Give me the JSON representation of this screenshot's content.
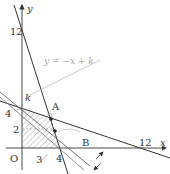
{
  "figure": {
    "axes": {
      "x_label": "x",
      "y_label": "y",
      "origin_label": "O",
      "x_ticks": [
        "3",
        "4",
        "12"
      ],
      "y_ticks": [
        "2",
        "4",
        "12"
      ]
    },
    "points": {
      "A": "A",
      "B": "B",
      "k": "k"
    },
    "equation_label": "y = −x + k",
    "lines": [
      {
        "name": "3x + y = 12",
        "through": [
          [
            0,
            12
          ],
          [
            4,
            0
          ]
        ]
      },
      {
        "name": "x + 3y = 12",
        "through": [
          [
            0,
            4
          ],
          [
            12,
            0
          ]
        ]
      },
      {
        "name": "y = -x + k (k=6, through A)",
        "through": [
          [
            0,
            6
          ],
          [
            6,
            0
          ]
        ]
      },
      {
        "name": "y = -x + k (moving)",
        "slope": -1
      }
    ],
    "feasible_region": {
      "vertices": [
        [
          0,
          0
        ],
        [
          4,
          0
        ],
        [
          3,
          3
        ],
        [
          0,
          4
        ]
      ],
      "fill": "hatched"
    },
    "colors": {
      "line": "#333333",
      "gray_line": "#aaaaaa",
      "hatch": "#888888"
    }
  }
}
